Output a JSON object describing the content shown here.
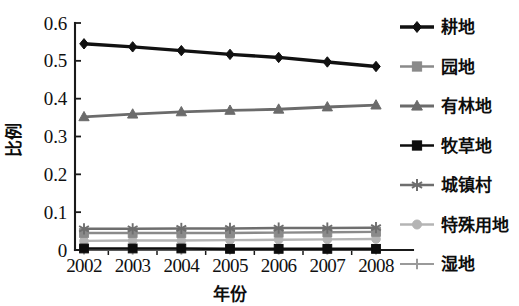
{
  "chart_data": {
    "type": "line",
    "title": "",
    "xlabel": "年份",
    "ylabel": "比例",
    "categories": [
      "2002",
      "2003",
      "2004",
      "2005",
      "2006",
      "2007",
      "2008"
    ],
    "x": [
      2002,
      2003,
      2004,
      2005,
      2006,
      2007,
      2008
    ],
    "ylim": [
      0,
      0.6
    ],
    "yticks": [
      0,
      0.1,
      0.2,
      0.3,
      0.4,
      0.5,
      0.6
    ],
    "ytick_labels": [
      "0",
      "0.1",
      "0.2",
      "0.3",
      "0.4",
      "0.5",
      "0.6"
    ],
    "grid": false,
    "legend_position": "right",
    "series": [
      {
        "name": "耕地",
        "marker": "diamond",
        "color": "#111111",
        "values": [
          0.545,
          0.537,
          0.527,
          0.517,
          0.509,
          0.497,
          0.485
        ]
      },
      {
        "name": "园地",
        "marker": "square",
        "color": "#8a8a8a",
        "values": [
          0.045,
          0.045,
          0.045,
          0.045,
          0.046,
          0.047,
          0.048
        ]
      },
      {
        "name": "有林地",
        "marker": "triangle",
        "color": "#6b6b6b",
        "values": [
          0.352,
          0.359,
          0.365,
          0.369,
          0.372,
          0.378,
          0.383
        ]
      },
      {
        "name": "牧草地",
        "marker": "square",
        "color": "#0d0d0d",
        "values": [
          0.004,
          0.004,
          0.004,
          0.003,
          0.003,
          0.003,
          0.003
        ]
      },
      {
        "name": "城镇村",
        "marker": "asterisk",
        "color": "#6e6e6e",
        "values": [
          0.056,
          0.056,
          0.057,
          0.057,
          0.058,
          0.058,
          0.059
        ]
      },
      {
        "name": "特殊用地",
        "marker": "circle",
        "color": "#b4b4b4",
        "values": [
          0.024,
          0.025,
          0.025,
          0.026,
          0.027,
          0.028,
          0.029
        ]
      },
      {
        "name": "湿地",
        "marker": "plus",
        "color": "#9a9a9a",
        "values": [
          0.001,
          0.001,
          0.001,
          0.001,
          0.001,
          0.001,
          0.001
        ]
      }
    ]
  },
  "axis": {
    "y_title": "比例",
    "x_title": "年份"
  },
  "colors": {
    "axis": "#1a1a1a",
    "background": "#ffffff",
    "text": "#101010"
  }
}
